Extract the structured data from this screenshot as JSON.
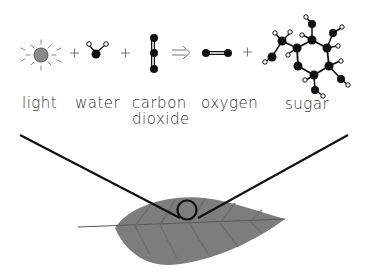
{
  "equation": {
    "reactants": [
      {
        "id": "light",
        "label": "light",
        "icon": "sun-icon"
      },
      {
        "id": "water",
        "label": "water",
        "icon": "water-molecule-icon"
      },
      {
        "id": "carbon_dioxide",
        "label_line1": "carbon",
        "label_line2": "dioxide",
        "icon": "co2-molecule-icon"
      }
    ],
    "arrow": "⇒",
    "plus": "+",
    "products": [
      {
        "id": "oxygen",
        "label": "oxygen",
        "icon": "o2-molecule-icon"
      },
      {
        "id": "sugar",
        "label": "sugar",
        "icon": "glucose-molecule-icon"
      }
    ]
  },
  "illustration": {
    "subject": "leaf",
    "callout": "zoom-in circle on leaf surface"
  },
  "colors": {
    "ink": "#111111",
    "leaf": "#7a7a7a",
    "sun": "#888888"
  }
}
